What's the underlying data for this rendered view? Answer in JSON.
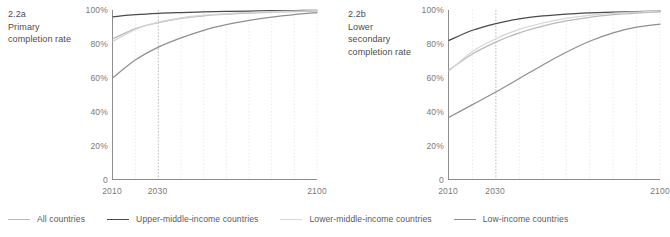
{
  "legend": {
    "position": "bottom",
    "items": [
      {
        "label": "All countries",
        "color": "#b9b9b9"
      },
      {
        "label": "Upper-middle-income countries",
        "color": "#4a4a4a"
      },
      {
        "label": "Lower-middle-income countries",
        "color": "#d6d6d6"
      },
      {
        "label": "Low-income countries",
        "color": "#8f8f8f"
      }
    ]
  },
  "chart_data": [
    {
      "type": "line",
      "id": "2.2a",
      "number": "2.2a",
      "title": "Primary completion rate",
      "xlabel": "",
      "ylabel": "",
      "xlim": [
        2010,
        2100
      ],
      "ylim": [
        0,
        100
      ],
      "grid": true,
      "gridlines_x": [
        2020,
        2030,
        2040,
        2050,
        2060,
        2070,
        2080,
        2090,
        2100
      ],
      "highlight_gridline_x": 2030,
      "xticks": [
        2010,
        2030,
        2100
      ],
      "xticklabels": [
        "2010",
        "2030",
        "2100"
      ],
      "yticks": [
        0,
        20,
        40,
        60,
        80,
        100
      ],
      "yticklabels": [
        "0",
        "20%",
        "40%",
        "60%",
        "80%",
        "100%"
      ],
      "x": [
        2010,
        2020,
        2030,
        2040,
        2050,
        2060,
        2070,
        2080,
        2090,
        2100
      ],
      "series": [
        {
          "name": "All countries",
          "color": "#b9b9b9",
          "values": [
            83,
            89,
            92.5,
            95,
            96.5,
            97.5,
            98.2,
            98.7,
            99.1,
            99.4
          ]
        },
        {
          "name": "Upper-middle-income countries",
          "color": "#4a4a4a",
          "values": [
            96,
            97.2,
            98,
            98.5,
            98.9,
            99.2,
            99.4,
            99.6,
            99.7,
            99.8
          ]
        },
        {
          "name": "Lower-middle-income countries",
          "color": "#d6d6d6",
          "values": [
            81.5,
            88.5,
            92.8,
            95.3,
            96.9,
            97.9,
            98.5,
            99,
            99.3,
            99.6
          ]
        },
        {
          "name": "Low-income countries",
          "color": "#8f8f8f",
          "values": [
            60,
            70.5,
            78,
            83.5,
            88,
            91.3,
            93.8,
            95.8,
            97.3,
            98.5
          ]
        }
      ]
    },
    {
      "type": "line",
      "id": "2.2b",
      "number": "2.2b",
      "title": "Lower secondary completion rate",
      "xlabel": "",
      "ylabel": "",
      "xlim": [
        2010,
        2100
      ],
      "ylim": [
        0,
        100
      ],
      "grid": true,
      "gridlines_x": [
        2020,
        2030,
        2040,
        2050,
        2060,
        2070,
        2080,
        2090,
        2100
      ],
      "highlight_gridline_x": 2030,
      "xticks": [
        2010,
        2030,
        2100
      ],
      "xticklabels": [
        "2010",
        "2030",
        "2100"
      ],
      "yticks": [
        0,
        20,
        40,
        60,
        80,
        100
      ],
      "yticklabels": [
        "0",
        "20%",
        "40%",
        "60%",
        "80%",
        "100%"
      ],
      "x": [
        2010,
        2020,
        2030,
        2040,
        2050,
        2060,
        2070,
        2080,
        2090,
        2100
      ],
      "series": [
        {
          "name": "All countries",
          "color": "#b9b9b9",
          "values": [
            64.5,
            74,
            81,
            86.5,
            90.5,
            93.5,
            95.7,
            97.2,
            98.2,
            98.9
          ]
        },
        {
          "name": "Upper-middle-income countries",
          "color": "#4a4a4a",
          "values": [
            82,
            88,
            92,
            94.8,
            96.5,
            97.6,
            98.3,
            98.8,
            99.1,
            99.3
          ]
        },
        {
          "name": "Lower-middle-income countries",
          "color": "#d6d6d6",
          "values": [
            64,
            75.5,
            83,
            88.5,
            92.3,
            95,
            96.8,
            98,
            98.8,
            99.4
          ]
        },
        {
          "name": "Low-income countries",
          "color": "#8f8f8f",
          "values": [
            36.5,
            44,
            51.5,
            59.5,
            67.5,
            75,
            81.5,
            86.5,
            89.8,
            91.7
          ]
        }
      ]
    }
  ]
}
